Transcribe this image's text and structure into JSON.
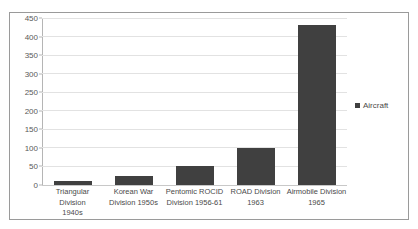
{
  "chart_data": {
    "type": "bar",
    "title": "",
    "xlabel": "",
    "ylabel": "",
    "ylim": [
      0,
      450
    ],
    "ytick_step": 50,
    "yticks": [
      0,
      50,
      100,
      150,
      200,
      250,
      300,
      350,
      400,
      450
    ],
    "ytick_labels": [
      "0",
      "50",
      "100",
      "150",
      "200",
      "250",
      "300",
      "350",
      "400",
      "450"
    ],
    "grid": true,
    "grid_axis": "y",
    "legend_position": "right",
    "categories": [
      "Triangular Division 1940s",
      "Korean War Division 1950s",
      "Pentomic ROCID Division 1956-61",
      "ROAD Division 1963",
      "Airmobile Division 1965"
    ],
    "category_lines": [
      [
        "Triangular Division",
        "1940s"
      ],
      [
        "Korean War",
        "Division 1950s"
      ],
      [
        "Pentomic ROCID",
        "Division 1956-61"
      ],
      [
        "ROAD Division",
        "1963"
      ],
      [
        "Airmobile Division",
        "1965"
      ]
    ],
    "series": [
      {
        "name": "Aircraft",
        "color": "#404040",
        "values": [
          10,
          25,
          50,
          100,
          430
        ]
      }
    ]
  },
  "legend": {
    "entries": [
      {
        "label": "Aircraft",
        "marker": "square-marker",
        "color": "#404040"
      }
    ]
  },
  "colors": {
    "bar": "#404040",
    "gridline": "#e2e2e2",
    "axis": "#b5b5b5",
    "border": "#9a9a9a",
    "tick_text": "#595959",
    "label_text": "#4a4a4a",
    "background": "#ffffff"
  }
}
